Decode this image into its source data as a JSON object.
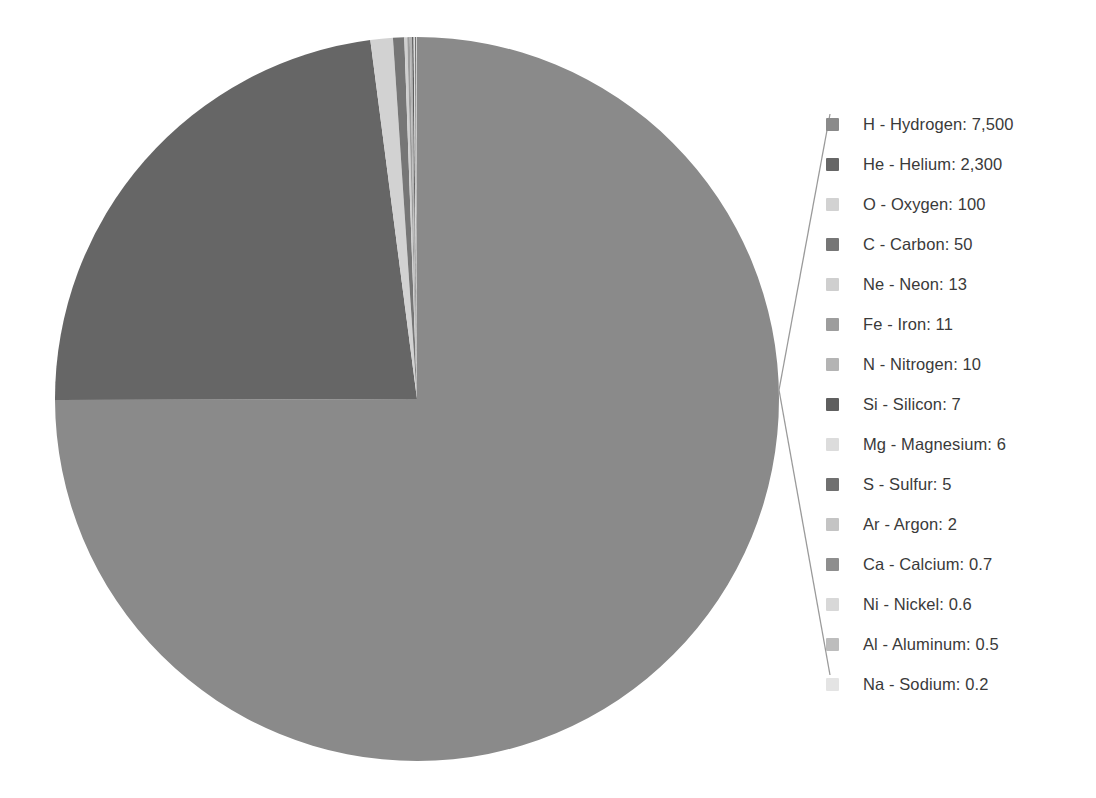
{
  "chart_data": {
    "type": "pie",
    "title": "",
    "subtitle": "",
    "unit": "relative abundance",
    "total": 10006.0,
    "start_angle_deg": 0,
    "direction": "clockwise",
    "legend_position": "right",
    "grid": false,
    "categories": [
      "H - Hydrogen",
      "He - Helium",
      "O - Oxygen",
      "C - Carbon",
      "Ne - Neon",
      "Fe - Iron",
      "N - Nitrogen",
      "Si - Silicon",
      "Mg - Magnesium",
      "S - Sulfur",
      "Ar - Argon",
      "Ca - Calcium",
      "Ni - Nickel",
      "Al - Aluminum",
      "Na - Sodium"
    ],
    "values": [
      7500,
      2300,
      100,
      50,
      13,
      11,
      10,
      7,
      6,
      5,
      2,
      0.7,
      0.6,
      0.5,
      0.2
    ],
    "value_labels": [
      "7,500",
      "2,300",
      "100",
      "50",
      "13",
      "11",
      "10",
      "7",
      "6",
      "5",
      "2",
      "0.7",
      "0.6",
      "0.5",
      "0.2"
    ],
    "colors": [
      "#8a8a8a",
      "#666666",
      "#d2d2d2",
      "#767676",
      "#cfcfcf",
      "#9d9d9d",
      "#b4b4b4",
      "#5f5f5f",
      "#dcdcdc",
      "#707070",
      "#c4c4c4",
      "#8e8e8e",
      "#d8d8d8",
      "#bdbdbd",
      "#e4e4e4"
    ]
  },
  "legend": {
    "items": [
      {
        "symbol": "H",
        "name": "Hydrogen",
        "label": "H - Hydrogen: 7,500",
        "value": "7,500",
        "color": "#8a8a8a"
      },
      {
        "symbol": "He",
        "name": "Helium",
        "label": "He - Helium: 2,300",
        "value": "2,300",
        "color": "#666666"
      },
      {
        "symbol": "O",
        "name": "Oxygen",
        "label": "O - Oxygen: 100",
        "value": "100",
        "color": "#d2d2d2"
      },
      {
        "symbol": "C",
        "name": "Carbon",
        "label": "C - Carbon: 50",
        "value": "50",
        "color": "#767676"
      },
      {
        "symbol": "Ne",
        "name": "Neon",
        "label": "Ne - Neon: 13",
        "value": "13",
        "color": "#cfcfcf"
      },
      {
        "symbol": "Fe",
        "name": "Iron",
        "label": "Fe - Iron: 11",
        "value": "11",
        "color": "#9d9d9d"
      },
      {
        "symbol": "N",
        "name": "Nitrogen",
        "label": "N - Nitrogen: 10",
        "value": "10",
        "color": "#b4b4b4"
      },
      {
        "symbol": "Si",
        "name": "Silicon",
        "label": "Si - Silicon: 7",
        "value": "7",
        "color": "#5f5f5f"
      },
      {
        "symbol": "Mg",
        "name": "Magnesium",
        "label": "Mg - Magnesium: 6",
        "value": "6",
        "color": "#dcdcdc"
      },
      {
        "symbol": "S",
        "name": "Sulfur",
        "label": "S - Sulfur: 5",
        "value": "5",
        "color": "#707070"
      },
      {
        "symbol": "Ar",
        "name": "Argon",
        "label": "Ar - Argon: 2",
        "value": "2",
        "color": "#c4c4c4"
      },
      {
        "symbol": "Ca",
        "name": "Calcium",
        "label": "Ca - Calcium: 0.7",
        "value": "0.7",
        "color": "#8e8e8e"
      },
      {
        "symbol": "Ni",
        "name": "Nickel",
        "label": "Ni - Nickel: 0.6",
        "value": "0.6",
        "color": "#d8d8d8"
      },
      {
        "symbol": "Al",
        "name": "Aluminum",
        "label": "Al - Aluminum: 0.5",
        "value": "0.5",
        "color": "#bdbdbd"
      },
      {
        "symbol": "Na",
        "name": "Sodium",
        "label": "Na - Sodium: 0.2",
        "value": "0.2",
        "color": "#e4e4e4"
      }
    ]
  },
  "geometry": {
    "center_x": 363,
    "center_y": 363,
    "radius": 362,
    "leader_apex_x": 9,
    "leader_apex_y": 300,
    "leader_top_x": 60,
    "leader_top_y": 24,
    "leader_bottom_x": 60,
    "leader_bottom_y": 585
  },
  "style": {
    "background": "#ffffff",
    "leader_color": "#9a9a9a",
    "text_color": "#3a3a3a"
  }
}
